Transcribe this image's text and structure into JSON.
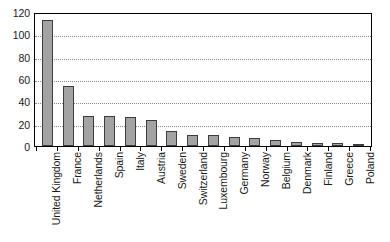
{
  "chart_data": {
    "type": "bar",
    "title": "",
    "subtitle": "",
    "xlabel": "",
    "ylabel": "",
    "ylim": [
      0,
      120
    ],
    "yticks": [
      0,
      20,
      40,
      60,
      80,
      100,
      120
    ],
    "ytick_labels": [
      "0",
      "20",
      "40",
      "60",
      "80",
      "100",
      "120"
    ],
    "grid": true,
    "grid_axis": "y",
    "grid_style": "dotted",
    "legend": false,
    "legend_position": "none",
    "orientation": "vertical",
    "bar_color": "#a3a3a3",
    "bar_edge_color": "#3d3d3d",
    "frame_color": "#000000",
    "background_color": "#ffffff",
    "label_rotation": 90,
    "categories": [
      "United Kingdom",
      "France",
      "Netherlands",
      "Spain",
      "Italy",
      "Austria",
      "Sweden",
      "Switzerland",
      "Luxembourg",
      "Germany",
      "Norway",
      "Belgium",
      "Denmark",
      "Finland",
      "Greece",
      "Poland"
    ],
    "values": [
      113,
      53.5,
      27,
      27,
      26,
      23,
      13,
      9.5,
      9.5,
      8,
      7.5,
      5.5,
      4,
      3,
      2.5,
      1
    ]
  }
}
